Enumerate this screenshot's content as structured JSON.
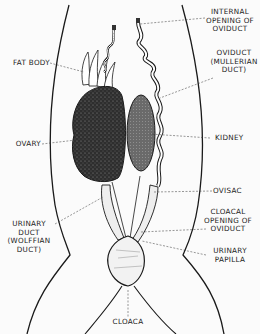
{
  "diagram": {
    "colors": {
      "ink": "#1a1a1a",
      "background": "#fbfbfb",
      "tissue_dark": "#3a3a3a",
      "kidney": "#5a5a5a"
    },
    "labels": {
      "fat_body": "FAT BODY",
      "ovary": "OVARY",
      "urinary_duct_1": "URINARY",
      "urinary_duct_2": "DUCT",
      "urinary_duct_3": "(WOLFFIAN",
      "urinary_duct_4": "DUCT)",
      "cloaca": "CLOACA",
      "internal_opening_1": "INTERNAL",
      "internal_opening_2": "OPENING OF",
      "internal_opening_3": "OVIDUCT",
      "oviduct_1": "OVIDUCT",
      "oviduct_2": "(MULLERIAN",
      "oviduct_3": "DUCT)",
      "kidney": "KIDNEY",
      "ovisac": "OVISAC",
      "cloacal_opening_1": "CLOACAL",
      "cloacal_opening_2": "OPENING OF",
      "cloacal_opening_3": "OVIDUCT",
      "urinary_papilla_1": "URINARY",
      "urinary_papilla_2": "PAPILLA"
    }
  }
}
